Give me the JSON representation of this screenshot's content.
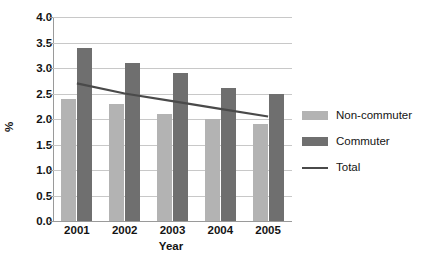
{
  "chart_data": {
    "type": "bar",
    "title": "",
    "xlabel": "Year",
    "ylabel": "%",
    "categories": [
      "2001",
      "2002",
      "2003",
      "2004",
      "2005"
    ],
    "ylim": [
      0.0,
      4.0
    ],
    "ytick_labels": [
      "0.0",
      "0.5",
      "1.0",
      "1.5",
      "2.0",
      "2.5",
      "3.0",
      "3.5",
      "4.0"
    ],
    "ytick_values": [
      0.0,
      0.5,
      1.0,
      1.5,
      2.0,
      2.5,
      3.0,
      3.5,
      4.0
    ],
    "grid": true,
    "legend_position": "right",
    "series": [
      {
        "name": "Non-commuter",
        "type": "bar",
        "color": "#b3b3b3",
        "values": [
          2.4,
          2.3,
          2.1,
          2.0,
          1.9
        ]
      },
      {
        "name": "Commuter",
        "type": "bar",
        "color": "#6f6f6f",
        "values": [
          3.4,
          3.1,
          2.9,
          2.6,
          2.5
        ]
      },
      {
        "name": "Total",
        "type": "line",
        "color": "#4a4a4a",
        "values": [
          2.7,
          2.5,
          2.35,
          2.2,
          2.05
        ]
      }
    ]
  },
  "legend": {
    "items": [
      {
        "label": "Non-commuter",
        "marker": "swatch-light"
      },
      {
        "label": "Commuter",
        "marker": "swatch-dark"
      },
      {
        "label": "Total",
        "marker": "line-segment"
      }
    ]
  }
}
